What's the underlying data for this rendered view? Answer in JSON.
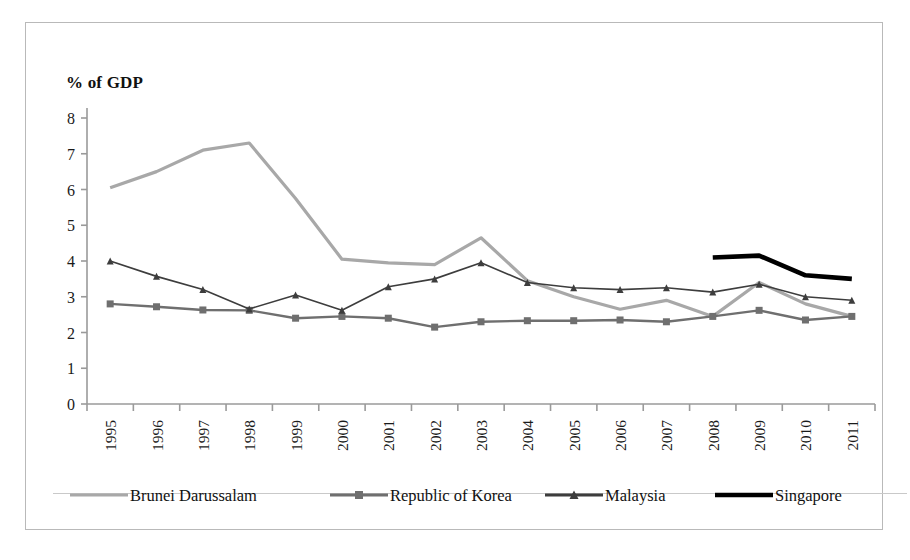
{
  "axis_title": "% of GDP",
  "chart_data": {
    "type": "line",
    "title": "",
    "subtitle": "",
    "xlabel": "",
    "ylabel": "% of GDP",
    "ylim": [
      0,
      8
    ],
    "ytick_step": 1,
    "yticks": [
      "0",
      "1",
      "2",
      "3",
      "4",
      "5",
      "6",
      "7",
      "8"
    ],
    "grid": false,
    "legend_position": "bottom",
    "categories": [
      "1995",
      "1996",
      "1997",
      "1998",
      "1999",
      "2000",
      "2001",
      "2002",
      "2003",
      "2004",
      "2005",
      "2006",
      "2007",
      "2008",
      "2009",
      "2010",
      "2011"
    ],
    "series": [
      {
        "name": "Brunei Darussalam",
        "color": "#a8a8a8",
        "marker": "none",
        "width": 3.2,
        "values": [
          6.05,
          6.5,
          7.1,
          7.3,
          5.75,
          4.05,
          3.95,
          3.9,
          4.65,
          3.45,
          3.0,
          2.65,
          2.9,
          2.45,
          3.4,
          2.8,
          2.45
        ]
      },
      {
        "name": "Republic of Korea",
        "color": "#6f6f6f",
        "marker": "square",
        "width": 2.4,
        "values": [
          2.8,
          2.72,
          2.63,
          2.62,
          2.4,
          2.45,
          2.4,
          2.15,
          2.3,
          2.33,
          2.33,
          2.35,
          2.3,
          2.45,
          2.62,
          2.35,
          2.45
        ]
      },
      {
        "name": "Malaysia",
        "color": "#3d3d3d",
        "marker": "triangle",
        "width": 1.6,
        "values": [
          4.0,
          3.57,
          3.2,
          2.66,
          3.05,
          2.62,
          3.28,
          3.5,
          3.95,
          3.4,
          3.25,
          3.2,
          3.25,
          3.13,
          3.35,
          3.0,
          2.9
        ]
      },
      {
        "name": "Singapore",
        "color": "#000000",
        "marker": "none",
        "width": 4.6,
        "values": [
          null,
          null,
          null,
          null,
          null,
          null,
          null,
          null,
          null,
          null,
          null,
          null,
          null,
          4.1,
          4.15,
          3.6,
          3.5
        ]
      }
    ]
  },
  "legend": [
    {
      "label": "Brunei Darussalam"
    },
    {
      "label": "Republic of Korea"
    },
    {
      "label": "Malaysia"
    },
    {
      "label": "Singapore"
    }
  ]
}
